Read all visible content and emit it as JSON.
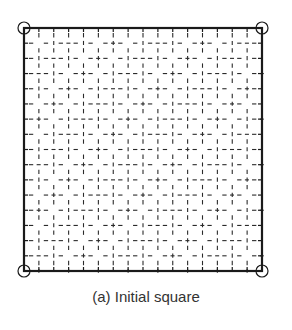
{
  "figure": {
    "caption": "(a) Initial square",
    "grid": {
      "divisions": 16,
      "x0": 24,
      "y0": 28,
      "x1": 262,
      "y1": 271
    },
    "corner_markers": [
      "top-left",
      "top-right",
      "bottom-left",
      "bottom-right"
    ],
    "colors": {
      "outline": "#1a1a1a",
      "dashes": "#2a2a2a",
      "caption": "#333333"
    }
  }
}
